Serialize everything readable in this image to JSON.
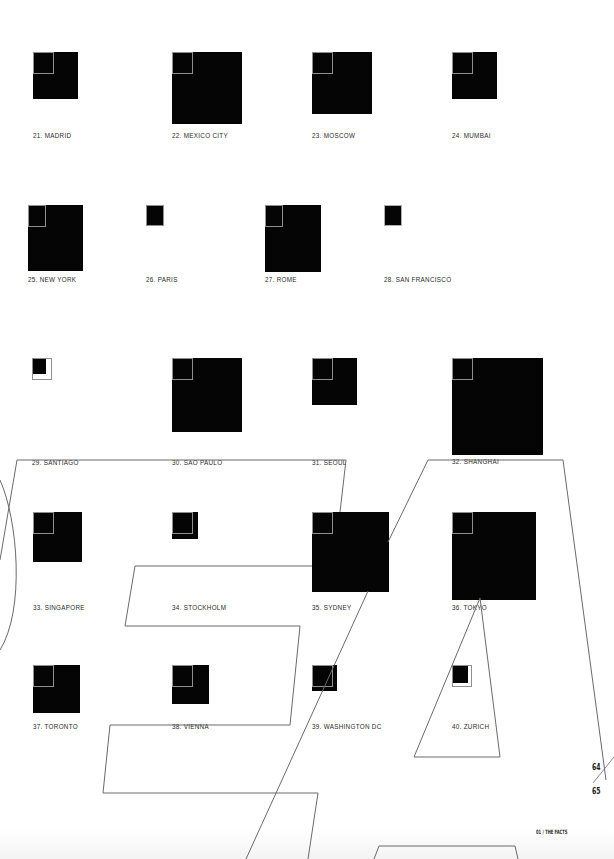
{
  "page": {
    "page_left": "64",
    "page_right": "65",
    "section": "01 / THE FACTS"
  },
  "legend": {
    "reference_square_px": 20,
    "reference_color": "#8f8f8f",
    "fill_color": "#050505"
  },
  "cities": [
    {
      "num": "21",
      "label": "21. MADRID",
      "w": 45,
      "h": 47,
      "x": 33,
      "y": 52,
      "label_y": 80
    },
    {
      "num": "22",
      "label": "22. MEXICO CITY",
      "w": 70,
      "h": 72,
      "x": 172,
      "y": 52,
      "label_y": 80
    },
    {
      "num": "23",
      "label": "23. MOSCOW",
      "w": 60,
      "h": 62,
      "x": 312,
      "y": 52,
      "label_y": 80
    },
    {
      "num": "24",
      "label": "24. MUMBAI",
      "w": 45,
      "h": 47,
      "x": 452,
      "y": 52,
      "label_y": 80
    },
    {
      "num": "25",
      "label": "25. NEW YORK",
      "w": 55,
      "h": 66,
      "x": 33,
      "y": 205,
      "label_y": 74
    },
    {
      "num": "26",
      "label": "26. PARIS",
      "w": 18,
      "h": 21,
      "x": 172,
      "y": 205,
      "label_y": 74
    },
    {
      "num": "27",
      "label": "27. ROME",
      "w": 56,
      "h": 67,
      "x": 312,
      "y": 205,
      "label_y": 74
    },
    {
      "num": "28",
      "label": "28. SAN FRANCISCO",
      "w": 17,
      "h": 21,
      "x": 452,
      "y": 205,
      "label_y": 74
    },
    {
      "num": "29",
      "label": "29. SANTIAGO",
      "w": 13,
      "h": 14,
      "x": 33,
      "y": 358,
      "label_y": 104
    },
    {
      "num": "30",
      "label": "30. SAO PAULO",
      "w": 61,
      "h": 74,
      "x": 172,
      "y": 358,
      "label_y": 104
    },
    {
      "num": "31",
      "label": "31. SEOUL",
      "w": 39,
      "h": 47,
      "x": 312,
      "y": 358,
      "label_y": 104
    },
    {
      "num": "32",
      "label": "32. SHANGHAI",
      "w": 79,
      "h": 97,
      "x": 452,
      "y": 358,
      "label_y": 104
    },
    {
      "num": "33",
      "label": "33. SINGAPORE",
      "w": 42,
      "h": 50,
      "x": 33,
      "y": 512,
      "label_y": 95
    },
    {
      "num": "34",
      "label": "34. STOCKHOLM",
      "w": 22,
      "h": 27,
      "x": 172,
      "y": 512,
      "label_y": 95
    },
    {
      "num": "35",
      "label": "35. SYDNEY",
      "w": 66,
      "h": 80,
      "x": 312,
      "y": 512,
      "label_y": 95
    },
    {
      "num": "36",
      "label": "36. TOKYO",
      "w": 72,
      "h": 88,
      "x": 452,
      "y": 512,
      "label_y": 95
    },
    {
      "num": "37",
      "label": "37. TORONTO",
      "w": 40,
      "h": 48,
      "x": 33,
      "y": 665,
      "label_y": 60
    },
    {
      "num": "38",
      "label": "38. VIENNA",
      "w": 32,
      "h": 39,
      "x": 172,
      "y": 665,
      "label_y": 60
    },
    {
      "num": "39",
      "label": "39. WASHINGTON DC",
      "w": 22,
      "h": 26,
      "x": 312,
      "y": 665,
      "label_y": 60
    },
    {
      "num": "40",
      "label": "40. ZURICH",
      "w": 14,
      "h": 15,
      "x": 452,
      "y": 665,
      "label_y": 60
    }
  ]
}
